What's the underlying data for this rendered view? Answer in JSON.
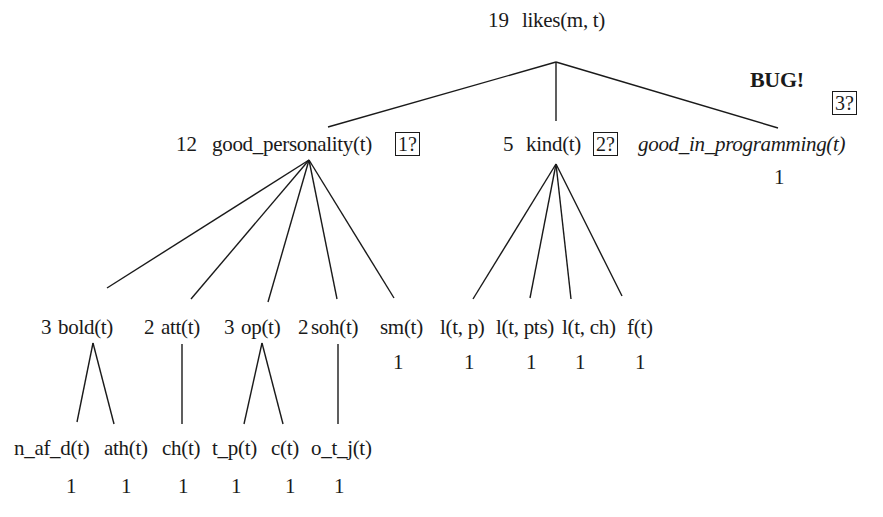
{
  "diagram": {
    "type": "weighted-tree",
    "root": {
      "weight": "19",
      "label": "likes(m, t)"
    },
    "level1": [
      {
        "weight": "12",
        "label": "good_personality(t)",
        "marker": "1?"
      },
      {
        "weight": "5",
        "label": "kind(t)",
        "marker": "2?"
      },
      {
        "weight": "1",
        "label": "good_in_programming(t)",
        "marker": "3?",
        "flag": "BUG!"
      }
    ],
    "good_personality_children": [
      {
        "weight": "3",
        "label": "bold(t)"
      },
      {
        "weight": "2",
        "label": "att(t)"
      },
      {
        "weight": "3",
        "label": "op(t)"
      },
      {
        "weight": "2",
        "label": "soh(t)"
      },
      {
        "weight": "1",
        "label": "sm(t)"
      }
    ],
    "kind_children": [
      {
        "weight": "1",
        "label": "l(t, p)"
      },
      {
        "weight": "1",
        "label": "l(t, pts)"
      },
      {
        "weight": "1",
        "label": "l(t, ch)"
      },
      {
        "weight": "1",
        "label": "f(t)"
      }
    ],
    "level3": [
      {
        "parent": "bold(t)",
        "weight": "1",
        "label": "n_af_d(t)"
      },
      {
        "parent": "bold(t)",
        "weight": "1",
        "label": "ath(t)"
      },
      {
        "parent": "att(t)",
        "weight": "1",
        "label": "ch(t)"
      },
      {
        "parent": "op(t)",
        "weight": "1",
        "label": "t_p(t)"
      },
      {
        "parent": "op(t)",
        "weight": "1",
        "label": "c(t)"
      },
      {
        "parent": "soh(t)",
        "weight": "1",
        "label": "o_t_j(t)"
      }
    ]
  }
}
